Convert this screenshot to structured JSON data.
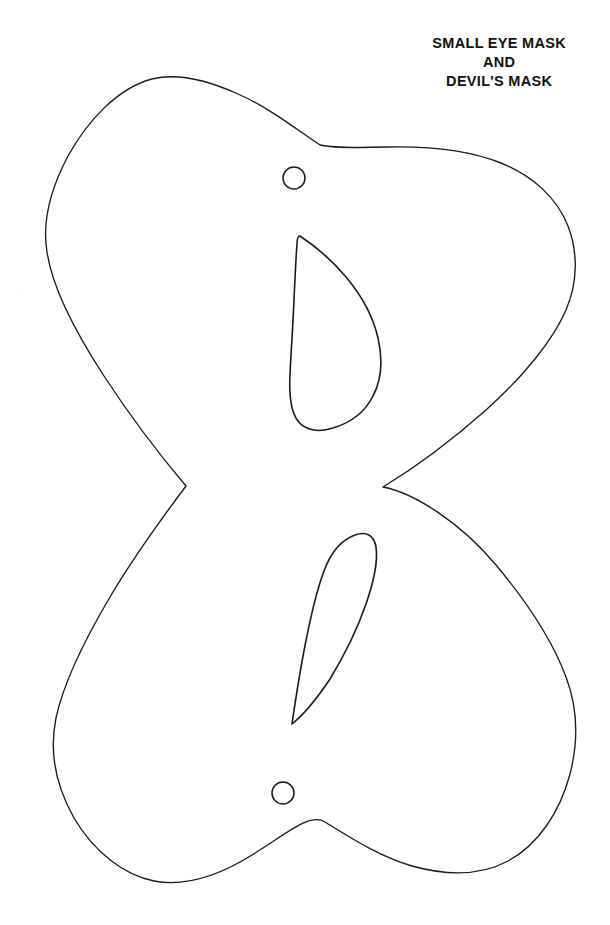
{
  "document": {
    "kind": "printable-craft-template",
    "background_color": "#ffffff",
    "ink_color": "#1a1a1a"
  },
  "title": {
    "lines": [
      "SMALL EYE MASK",
      "AND",
      "DEVIL'S MASK"
    ],
    "line1": "SMALL EYE MASK",
    "line2": "AND",
    "line3": "DEVIL'S MASK",
    "align": "center",
    "weight": "bold",
    "color": "#111111"
  },
  "template": {
    "outline_name": "mask-body-outline",
    "stroke_color": "#1a1a1a",
    "stroke_width": 1.3,
    "fill": "none",
    "description": "Hourglass / bowtie mask blank with four rounded lobes pinched at a central waist",
    "extents": {
      "top": 77,
      "bottom": 882,
      "left": 42,
      "right": 578
    },
    "waist_left_point": {
      "x": 186,
      "y": 486
    },
    "waist_right_point": {
      "x": 383,
      "y": 487
    },
    "top_notch_point": {
      "x": 320,
      "y": 145
    },
    "bottom_notch_point": {
      "x": 325,
      "y": 822
    }
  },
  "eye_holes": [
    {
      "name": "upper-eye-hole",
      "orientation": "point-up-left",
      "stroke_color": "#1a1a1a",
      "bounds": {
        "x": 289,
        "y": 235,
        "width": 90,
        "height": 196
      }
    },
    {
      "name": "lower-eye-hole",
      "orientation": "point-down-left",
      "stroke_color": "#1a1a1a",
      "bounds": {
        "x": 286,
        "y": 532,
        "width": 92,
        "height": 192
      }
    }
  ],
  "string_holes": [
    {
      "name": "upper-string-hole",
      "cx": 294,
      "cy": 178,
      "r": 11,
      "stroke_color": "#1a1a1a"
    },
    {
      "name": "lower-string-hole",
      "cx": 283,
      "cy": 793,
      "r": 11,
      "stroke_color": "#1a1a1a"
    }
  ]
}
